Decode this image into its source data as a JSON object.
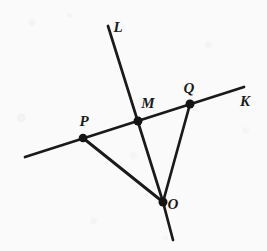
{
  "figure": {
    "width": 267,
    "height": 251,
    "background_color": "#fbfafa",
    "ink_color": "#1a1a1a"
  },
  "points": [
    {
      "id": "P",
      "label": "P",
      "x": 83,
      "y": 138,
      "label_x": 84,
      "label_y": 121,
      "dot_r": 4.2
    },
    {
      "id": "M",
      "label": "M",
      "x": 138,
      "y": 121,
      "label_x": 148,
      "label_y": 103,
      "dot_r": 4.4
    },
    {
      "id": "Q",
      "label": "Q",
      "x": 190,
      "y": 104,
      "label_x": 189,
      "label_y": 88,
      "dot_r": 4.4
    },
    {
      "id": "O",
      "label": "O",
      "x": 163,
      "y": 202,
      "label_x": 173,
      "label_y": 204,
      "dot_r": 4.4
    }
  ],
  "ray_labels": [
    {
      "id": "L",
      "label": "L",
      "label_x": 118,
      "label_y": 27
    },
    {
      "id": "K",
      "label": "K",
      "label_x": 245,
      "label_y": 101
    }
  ],
  "segments": [
    {
      "id": "line-PK",
      "name": "line-through-P-M-Q-toward-K",
      "x1": 25,
      "y1": 157,
      "x2": 244,
      "y2": 87,
      "stroke_width": 2.6
    },
    {
      "id": "line-L-upper",
      "name": "line-L-from-top-through-M-to-O",
      "x1": 108,
      "y1": 26,
      "x2": 163,
      "y2": 202,
      "stroke_width": 2.6
    },
    {
      "id": "line-L-lower",
      "name": "line-L-below-O",
      "x1": 163,
      "y1": 202,
      "x2": 173,
      "y2": 240,
      "stroke_width": 2.6
    },
    {
      "id": "segment-PO",
      "name": "segment-P-to-O",
      "x1": 83,
      "y1": 138,
      "x2": 163,
      "y2": 202,
      "stroke_width": 2.6
    },
    {
      "id": "segment-QO",
      "name": "segment-Q-to-O",
      "x1": 190,
      "y1": 104,
      "x2": 163,
      "y2": 202,
      "stroke_width": 2.6
    }
  ]
}
